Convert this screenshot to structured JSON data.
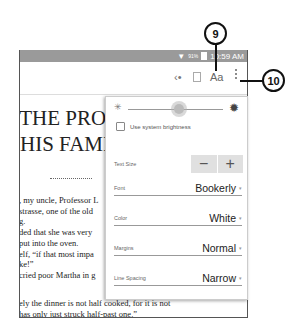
{
  "status_bar": {
    "signal_icon": "wifi-signal-icon",
    "battery_pct": "91%",
    "battery_icon": "battery-icon",
    "time": "10:59 AM"
  },
  "toolbar": {
    "share_icon": "share-icon",
    "bookmark_icon": "book-icon",
    "font_settings_label": "Aa",
    "overflow_icon": "more-vert-icon"
  },
  "book": {
    "chapter_line1": ".THE PROFESSOR AND",
    "chapter_line2": "HIS FAMILY",
    "lines": [
      ", my uncle, Professor L",
      "strasse, one of the old",
      "g.",
      "ded that she was very",
      "put into the oven.",
      "elf, “if that most impa",
      "ke!”",
      "cried poor Martha in g"
    ],
    "lines2": [
      "ely the dinner is not half cooked, for it is not",
      "has only just struck half-past one.”"
    ]
  },
  "settings_panel": {
    "brightness": {
      "low_icon": "sun-small-icon",
      "high_icon": "sun-large-icon",
      "value_pct": 45
    },
    "use_system_brightness": {
      "label": "Use system brightness",
      "checked": false
    },
    "text_size": {
      "label": "Text Size",
      "decrease": "−",
      "increase": "+"
    },
    "font": {
      "label": "Font",
      "value": "Bookerly"
    },
    "color": {
      "label": "Color",
      "value": "White"
    },
    "margins": {
      "label": "Margins",
      "value": "Normal"
    },
    "line_spacing": {
      "label": "Line Spacing",
      "value": "Narrow"
    }
  },
  "callouts": [
    {
      "number": "9"
    },
    {
      "number": "10"
    }
  ]
}
